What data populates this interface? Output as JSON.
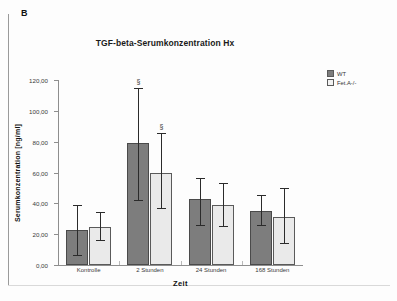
{
  "panel": {
    "letter": "B"
  },
  "chart_data": {
    "type": "bar",
    "title": "TGF-beta-Serumkonzentration Hx",
    "xlabel": "Zeit",
    "ylabel": "Serumkonzentration [ng/ml]",
    "categories": [
      "Kontrolle",
      "2 Stunden",
      "24 Stunden",
      "168 Stunden"
    ],
    "ylim": [
      0,
      120
    ],
    "yticks": [
      0,
      20,
      40,
      60,
      80,
      100,
      120
    ],
    "ytick_labels": [
      "0,00",
      "20,00",
      "40,00",
      "60,00",
      "80,00",
      "100,00",
      "120,00"
    ],
    "grid": false,
    "legend_position": "right",
    "series": [
      {
        "name": "WT",
        "color": "#7d7d7d",
        "values": [
          22.5,
          79.0,
          42.5,
          35.0
        ],
        "err_low": [
          16.5,
          37.5,
          17.5,
          10.0
        ],
        "err_high": [
          15.5,
          35.0,
          13.0,
          9.5
        ],
        "annotations": [
          "",
          "§",
          "",
          ""
        ]
      },
      {
        "name": "Fet.A-/-",
        "color": "#eaeaea",
        "values": [
          24.5,
          60.0,
          39.0,
          31.0
        ],
        "err_low": [
          9.0,
          23.5,
          14.5,
          17.5
        ],
        "err_high": [
          9.5,
          25.0,
          13.5,
          18.0
        ],
        "annotations": [
          "",
          "§",
          "",
          ""
        ]
      }
    ]
  },
  "legend": {
    "items": [
      {
        "label": "WT",
        "color": "#7d7d7d"
      },
      {
        "label": "Fet.A-/-",
        "color": "#f2f2f2"
      }
    ]
  }
}
